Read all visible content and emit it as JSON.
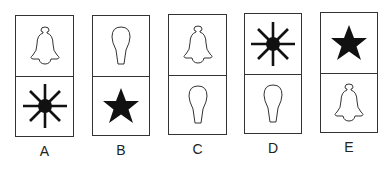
{
  "options": [
    {
      "label": "A",
      "top": "bell",
      "bottom": "sunburst"
    },
    {
      "label": "B",
      "top": "bulb",
      "bottom": "star"
    },
    {
      "label": "C",
      "top": "bell",
      "bottom": "bulb"
    },
    {
      "label": "D",
      "top": "sunburst",
      "bottom": "bulb"
    },
    {
      "label": "E",
      "top": "star",
      "bottom": "bell"
    }
  ]
}
